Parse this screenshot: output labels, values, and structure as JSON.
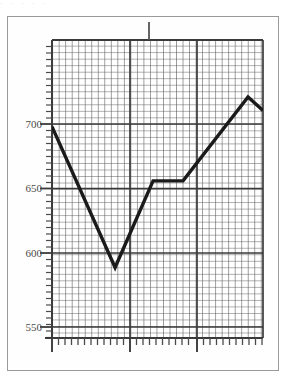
{
  "figure": {
    "top_artifact_text": "·  ·    ·      ·     ·",
    "frame_color": "#9a9a9a",
    "background_color": "#ffffff",
    "grid_color": "#555555",
    "line_color": "#1a1a1a",
    "axis_color": "#3a3a3a"
  },
  "axis": {
    "y_labels": [
      "700",
      "650",
      "600",
      "550"
    ],
    "y_label_values": [
      700,
      650,
      600,
      550
    ]
  },
  "chart_data": {
    "type": "line",
    "title": "",
    "subtitle": "",
    "xlabel": "",
    "ylabel": "",
    "ylim": [
      550,
      730
    ],
    "xlim": [
      0,
      100
    ],
    "grid": true,
    "grid_minor_step": 5,
    "legend": null,
    "legend_position": "none",
    "yticks": [
      550,
      600,
      650,
      700
    ],
    "ytick_labels": [
      "550",
      "600",
      "650",
      "700"
    ],
    "xticks": [
      0,
      37,
      69
    ],
    "xtick_labels": [
      "",
      "",
      ""
    ],
    "series": [
      {
        "name": "series-1",
        "color": "#1a1a1a",
        "x": [
          0,
          29.9,
          47.9,
          62.1,
          92.9,
          100
        ],
        "y": [
          698,
          594,
          658,
          658,
          720,
          710
        ]
      }
    ],
    "annotations": []
  }
}
